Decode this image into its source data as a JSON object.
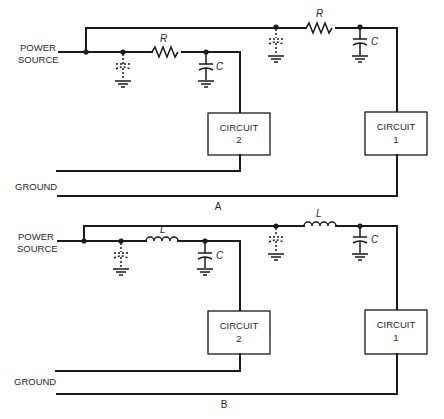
{
  "diagrams": [
    {
      "id": "A",
      "caption": "A",
      "power_source_label": [
        "POWER",
        "SOURCE"
      ],
      "ground_label": "GROUND",
      "series_element": "resistor",
      "series_label": "R",
      "cap_label": "C",
      "circuits": [
        {
          "label": "CIRCUIT",
          "number": "2"
        },
        {
          "label": "CIRCUIT",
          "number": "1"
        }
      ]
    },
    {
      "id": "B",
      "caption": "B",
      "power_source_label": [
        "POWER",
        "SOURCE"
      ],
      "ground_label": "GROUND",
      "series_element": "inductor",
      "series_label": "L",
      "cap_label": "C",
      "circuits": [
        {
          "label": "CIRCUIT",
          "number": "2"
        },
        {
          "label": "CIRCUIT",
          "number": "1"
        }
      ]
    }
  ],
  "colors": {
    "ink": "#1a1a1a",
    "background": "#ffffff"
  }
}
